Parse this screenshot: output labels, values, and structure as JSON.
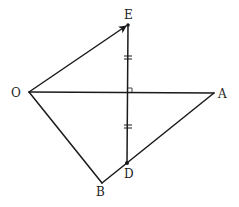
{
  "diagram": {
    "type": "geometry",
    "points": {
      "O": {
        "label": "O",
        "x": 29,
        "y": 92
      },
      "E": {
        "label": "E",
        "x": 128,
        "y": 25
      },
      "A": {
        "label": "A",
        "x": 214,
        "y": 93
      },
      "D": {
        "label": "D",
        "x": 127,
        "y": 163
      },
      "B": {
        "label": "B",
        "x": 102,
        "y": 183
      }
    },
    "segments": [
      {
        "from": "O",
        "to": "E",
        "arrow": true
      },
      {
        "from": "O",
        "to": "A"
      },
      {
        "from": "O",
        "to": "B"
      },
      {
        "from": "B",
        "to": "A"
      },
      {
        "from": "E",
        "to": "D"
      }
    ],
    "annotations": {
      "right_angle": "ED ⟂ OA",
      "equal_marks": "double tick marks on both halves of ED (ED bisected by OA)"
    },
    "colors": {
      "line": "#1a1a1a",
      "label": "#222222",
      "background": "#ffffff"
    }
  }
}
